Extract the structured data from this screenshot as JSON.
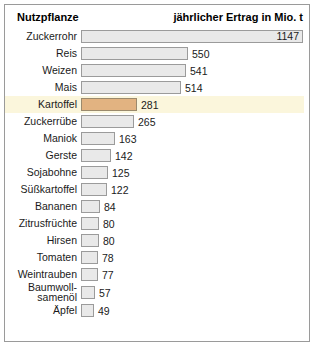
{
  "header": {
    "left": "Nutzpflanze",
    "right": "jährlicher Ertrag in Mio. t"
  },
  "colors": {
    "frame_border": "#9a9a9a",
    "bar_fill": "#e9e9e9",
    "bar_border": "#9b9b9b",
    "accent_bar_fill": "#e2b381",
    "highlight_row_bg": "#fbf6dc",
    "text": "#1a1a1a",
    "background": "#ffffff"
  },
  "photo": {
    "name": "potato-pile-photo",
    "alt": "Haufen Kartoffeln"
  },
  "chart_data": {
    "type": "bar",
    "title": "Nutzpflanze",
    "xlabel": "jährlicher Ertrag in Mio. t",
    "ylabel": "Nutzpflanze",
    "orientation": "horizontal",
    "grid": false,
    "legend": false,
    "xlim": [
      0,
      1147
    ],
    "unit": "Mio. t",
    "highlight": "Kartoffel",
    "categories": [
      "Zuckerrohr",
      "Reis",
      "Weizen",
      "Mais",
      "Kartoffel",
      "Zuckerrübe",
      "Maniok",
      "Gerste",
      "Sojabohne",
      "Süßkartoffel",
      "Bananen",
      "Zitrusfrüchte",
      "Hirsen",
      "Tomaten",
      "Weintrauben",
      "Baumwollsamenöl",
      "Äpfel"
    ],
    "values": [
      1147,
      550,
      541,
      514,
      281,
      265,
      163,
      142,
      125,
      122,
      84,
      80,
      80,
      78,
      77,
      57,
      49
    ]
  },
  "rows": [
    {
      "label": "Zuckerrohr",
      "value": "1147",
      "bar_px": 222,
      "value_inside": true,
      "highlight": false,
      "tall": false
    },
    {
      "label": "Reis",
      "value": "550",
      "bar_px": 107,
      "value_inside": false,
      "highlight": false,
      "tall": false
    },
    {
      "label": "Weizen",
      "value": "541",
      "bar_px": 105,
      "value_inside": false,
      "highlight": false,
      "tall": false
    },
    {
      "label": "Mais",
      "value": "514",
      "bar_px": 100,
      "value_inside": false,
      "highlight": false,
      "tall": false
    },
    {
      "label": "Kartoffel",
      "value": "281",
      "bar_px": 56,
      "value_inside": false,
      "highlight": true,
      "tall": false
    },
    {
      "label": "Zuckerrübe",
      "value": "265",
      "bar_px": 53,
      "value_inside": false,
      "highlight": false,
      "tall": false
    },
    {
      "label": "Maniok",
      "value": "163",
      "bar_px": 34,
      "value_inside": false,
      "highlight": false,
      "tall": false
    },
    {
      "label": "Gerste",
      "value": "142",
      "bar_px": 30,
      "value_inside": false,
      "highlight": false,
      "tall": false
    },
    {
      "label": "Sojabohne",
      "value": "125",
      "bar_px": 27,
      "value_inside": false,
      "highlight": false,
      "tall": false
    },
    {
      "label": "Süßkartoffel",
      "value": "122",
      "bar_px": 26,
      "value_inside": false,
      "highlight": false,
      "tall": false
    },
    {
      "label": "Bananen",
      "value": "84",
      "bar_px": 19,
      "value_inside": false,
      "highlight": false,
      "tall": false
    },
    {
      "label": "Zitrusfrüchte",
      "value": "80",
      "bar_px": 18,
      "value_inside": false,
      "highlight": false,
      "tall": false
    },
    {
      "label": "Hirsen",
      "value": "80",
      "bar_px": 18,
      "value_inside": false,
      "highlight": false,
      "tall": false
    },
    {
      "label": "Tomaten",
      "value": "78",
      "bar_px": 17,
      "value_inside": false,
      "highlight": false,
      "tall": false
    },
    {
      "label": "Weintrauben",
      "value": "77",
      "bar_px": 17,
      "value_inside": false,
      "highlight": false,
      "tall": false
    },
    {
      "label": "Baumwoll-",
      "label2": "samenöl",
      "value": "57",
      "bar_px": 14,
      "value_inside": false,
      "highlight": false,
      "tall": true
    },
    {
      "label": "Äpfel",
      "value": "49",
      "bar_px": 13,
      "value_inside": false,
      "highlight": false,
      "tall": false
    }
  ]
}
